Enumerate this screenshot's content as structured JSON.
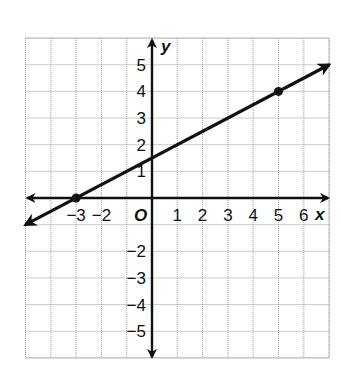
{
  "chart_data": {
    "type": "line",
    "title": "",
    "xlabel": "x",
    "ylabel": "y",
    "origin_label": "O",
    "xlim": [
      -5,
      7
    ],
    "ylim": [
      -6,
      6
    ],
    "grid": true,
    "x_ticks": [
      {
        "value": -3,
        "label": "−3"
      },
      {
        "value": -2,
        "label": "−2"
      },
      {
        "value": 1,
        "label": "1"
      },
      {
        "value": 2,
        "label": "2"
      },
      {
        "value": 3,
        "label": "3"
      },
      {
        "value": 4,
        "label": "4"
      },
      {
        "value": 5,
        "label": "5"
      },
      {
        "value": 6,
        "label": "6"
      }
    ],
    "y_ticks": [
      {
        "value": 5,
        "label": "5"
      },
      {
        "value": 4,
        "label": "4"
      },
      {
        "value": 3,
        "label": "3"
      },
      {
        "value": 2,
        "label": "2"
      },
      {
        "value": 1,
        "label": "1"
      },
      {
        "value": -2,
        "label": "−2"
      },
      {
        "value": -3,
        "label": "−3"
      },
      {
        "value": -4,
        "label": "−4"
      },
      {
        "value": -5,
        "label": "−5"
      }
    ],
    "series": [
      {
        "name": "line",
        "equation": "y = 0.5x + 1.5",
        "slope": 0.5,
        "intercept": 1.5,
        "extends_both_directions": true,
        "line_extent": {
          "x": [
            -5,
            7
          ],
          "y": [
            -1,
            5
          ]
        },
        "marked_points": [
          {
            "x": -3,
            "y": 0
          },
          {
            "x": 5,
            "y": 4
          }
        ]
      }
    ],
    "colors": {
      "line": "#111111",
      "grid": "#9a9a9a",
      "axes": "#111111"
    }
  }
}
